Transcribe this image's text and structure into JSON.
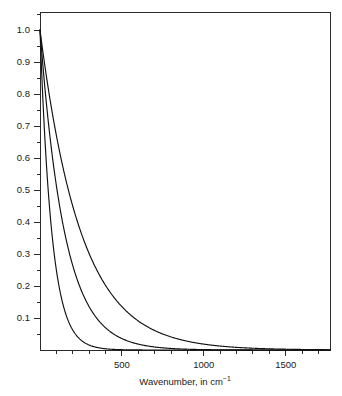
{
  "figure": {
    "background_color": "#ffffff",
    "axis_color": "#2b2b2b",
    "curve_color": "#111111",
    "plot_box": {
      "left": 40,
      "top": 12,
      "right": 330,
      "bottom": 350
    }
  },
  "chart_data": {
    "type": "line",
    "title": "",
    "subtitle": "",
    "xlabel_parts": {
      "main": "Wavenumber, in cm",
      "superscript": "−1"
    },
    "xlabel": "Wavenumber, in cm⁻¹",
    "ylabel": "",
    "xlim": [
      0,
      1770
    ],
    "ylim": [
      0,
      1.0563
    ],
    "grid": false,
    "legend": null,
    "x_major_ticks": [
      500,
      1000,
      1500
    ],
    "x_major_tick_labels": [
      "500",
      "1000",
      "1500"
    ],
    "x_minor_tick_step": 100,
    "x_minor_ticks": [
      100,
      200,
      300,
      400,
      500,
      600,
      700,
      800,
      900,
      1000,
      1100,
      1200,
      1300,
      1400,
      1500,
      1600,
      1700
    ],
    "y_major_ticks": [
      0.1,
      0.2,
      0.3,
      0.4,
      0.5,
      0.6,
      0.7,
      0.8,
      0.9,
      1.0
    ],
    "y_major_tick_labels": [
      "0.1",
      "0.2",
      "0.3",
      "0.4",
      "0.5",
      "0.6",
      "0.7",
      "0.8",
      "0.9",
      "1.0"
    ],
    "y_minor_tick_step": 0.05,
    "x": [
      0,
      20,
      40,
      60,
      80,
      100,
      125,
      150,
      175,
      200,
      250,
      300,
      350,
      400,
      450,
      500,
      550,
      600,
      700,
      800,
      900,
      1000,
      1100,
      1200,
      1300,
      1400,
      1500,
      1600,
      1700,
      1770
    ],
    "series": [
      {
        "name": "curve-1-fast-decay",
        "decay_constant_cm_inv": 72,
        "values": [
          1.0,
          0.757,
          0.574,
          0.435,
          0.329,
          0.25,
          0.176,
          0.124,
          0.087,
          0.062,
          0.031,
          0.015,
          0.008,
          0.004,
          0.002,
          0.001,
          0.0005,
          0.0002,
          0.0,
          0.0,
          0.0,
          0.0,
          0.0,
          0.0,
          0.0,
          0.0,
          0.0,
          0.0,
          0.0,
          0.0
        ]
      },
      {
        "name": "curve-2-medium-decay",
        "decay_constant_cm_inv": 150,
        "values": [
          1.0,
          0.876,
          0.766,
          0.67,
          0.587,
          0.513,
          0.435,
          0.368,
          0.312,
          0.264,
          0.189,
          0.135,
          0.097,
          0.069,
          0.05,
          0.036,
          0.025,
          0.018,
          0.009,
          0.005,
          0.0024,
          0.0013,
          0.0006,
          0.0003,
          0.0002,
          0.0001,
          0.0,
          0.0,
          0.0,
          0.0
        ]
      },
      {
        "name": "curve-3-slow-decay",
        "decay_constant_cm_inv": 250,
        "values": [
          1.0,
          0.923,
          0.852,
          0.787,
          0.726,
          0.67,
          0.607,
          0.549,
          0.497,
          0.449,
          0.368,
          0.301,
          0.247,
          0.202,
          0.165,
          0.135,
          0.111,
          0.091,
          0.061,
          0.041,
          0.027,
          0.018,
          0.012,
          0.008,
          0.0055,
          0.0037,
          0.0025,
          0.0017,
          0.0011,
          0.0008
        ]
      }
    ]
  }
}
